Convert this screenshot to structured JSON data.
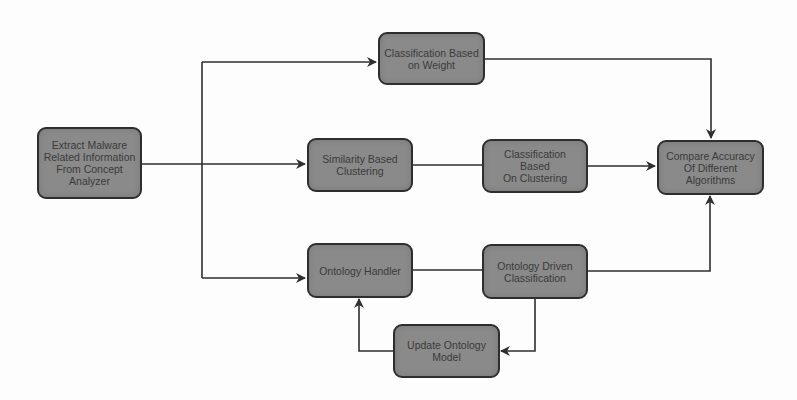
{
  "diagram": {
    "type": "flowchart",
    "colors": {
      "node_fill": "#8a8a8a",
      "node_border": "#2e2e2e",
      "node_text": "#3a3a3a",
      "edge": "#2e2e2e",
      "background": "#fdfdfd"
    },
    "nodes": {
      "extract": {
        "label": "Extract Malware\nRelated Information\nFrom Concept\nAnalyzer"
      },
      "weight": {
        "label": "Classification Based\non Weight"
      },
      "similarity": {
        "label": "Similarity Based\nClustering"
      },
      "clustering": {
        "label": "Classification Based\nOn Clustering"
      },
      "compare": {
        "label": "Compare Accuracy\nOf Different\nAlgorithms"
      },
      "ontology_handler": {
        "label": "Ontology Handler"
      },
      "ontology_driven": {
        "label": "Ontology Driven\nClassification"
      },
      "update_ontology": {
        "label": "Update Ontology\nModel"
      }
    },
    "edges": [
      {
        "from": "extract",
        "to": "weight"
      },
      {
        "from": "extract",
        "to": "similarity"
      },
      {
        "from": "extract",
        "to": "ontology_handler"
      },
      {
        "from": "weight",
        "to": "compare"
      },
      {
        "from": "similarity",
        "to": "clustering"
      },
      {
        "from": "clustering",
        "to": "compare"
      },
      {
        "from": "ontology_handler",
        "to": "ontology_driven"
      },
      {
        "from": "ontology_driven",
        "to": "compare"
      },
      {
        "from": "ontology_driven",
        "to": "update_ontology"
      },
      {
        "from": "update_ontology",
        "to": "ontology_handler"
      }
    ]
  }
}
